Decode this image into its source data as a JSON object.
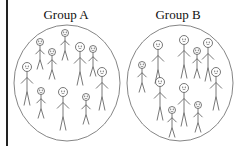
{
  "groups": [
    {
      "title": "Group A",
      "ellipse": {
        "cx": 67,
        "cy": 83,
        "rx": 53,
        "ry": 58
      },
      "figures": [
        {
          "x": 65,
          "y": 33,
          "size": "small"
        },
        {
          "x": 40,
          "y": 42,
          "size": "small"
        },
        {
          "x": 52,
          "y": 52,
          "size": "small"
        },
        {
          "x": 80,
          "y": 47,
          "size": "large"
        },
        {
          "x": 93,
          "y": 49,
          "size": "small"
        },
        {
          "x": 27,
          "y": 67,
          "size": "large"
        },
        {
          "x": 102,
          "y": 72,
          "size": "large"
        },
        {
          "x": 41,
          "y": 91,
          "size": "small"
        },
        {
          "x": 63,
          "y": 92,
          "size": "large"
        },
        {
          "x": 86,
          "y": 97,
          "size": "small"
        }
      ]
    },
    {
      "title": "Group B",
      "ellipse": {
        "cx": 180,
        "cy": 83,
        "rx": 53,
        "ry": 58
      },
      "figures": [
        {
          "x": 142,
          "y": 65,
          "size": "small"
        },
        {
          "x": 158,
          "y": 45,
          "size": "large"
        },
        {
          "x": 184,
          "y": 40,
          "size": "large"
        },
        {
          "x": 197,
          "y": 51,
          "size": "small"
        },
        {
          "x": 208,
          "y": 43,
          "size": "large"
        },
        {
          "x": 216,
          "y": 72,
          "size": "large"
        },
        {
          "x": 160,
          "y": 82,
          "size": "large"
        },
        {
          "x": 184,
          "y": 88,
          "size": "large"
        },
        {
          "x": 172,
          "y": 110,
          "size": "small"
        },
        {
          "x": 198,
          "y": 105,
          "size": "small"
        }
      ]
    }
  ],
  "colors": {
    "line": "#555555",
    "ellipse": "#777777",
    "text": "#111111",
    "bar": "#222222"
  }
}
